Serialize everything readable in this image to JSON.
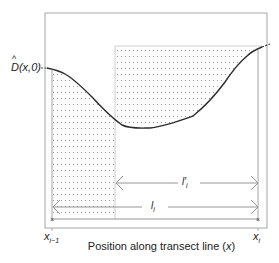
{
  "diagram": {
    "y_label": {
      "symbol": "D",
      "hat": "^",
      "args": "(x,0)"
    },
    "x_axis_label": "Position along transect line (x)",
    "x_axis_label_prefix": "Position along transect line (",
    "x_axis_label_var": "x",
    "x_axis_label_suffix": ")",
    "left_marker": {
      "var": "x",
      "sub": "i−1"
    },
    "right_marker": {
      "var": "x",
      "sub": "i"
    },
    "inner_interval": {
      "var": "l′",
      "sub": "i"
    },
    "outer_interval": {
      "var": "l",
      "sub": "i"
    },
    "colors": {
      "curve": "#2b2b2b",
      "frame": "#9a9a9a",
      "dots": "#8c8c8c",
      "arrows": "#7a7a7a"
    }
  }
}
